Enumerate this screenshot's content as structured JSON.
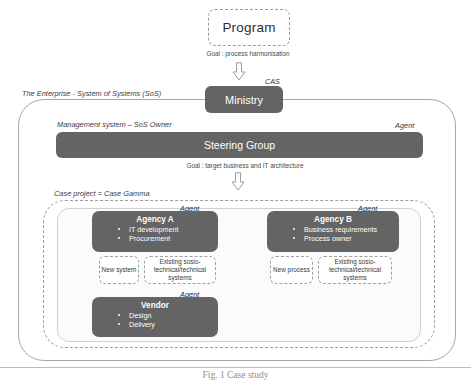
{
  "program": {
    "label": "Program",
    "goal": "Goal : process harmonisation"
  },
  "cas": {
    "tag": "CAS",
    "label": "Ministry"
  },
  "enterprise": {
    "title": "The Enterprise - System of Systems (SoS)"
  },
  "management": {
    "title": "Management system – SoS Owner",
    "agent_tag": "Agent",
    "label": "Steering Group",
    "goal": "Goal : target business and IT architecture"
  },
  "case_project": {
    "title": "Case project = Case Gamma"
  },
  "agents": [
    {
      "agent_tag": "Agent",
      "title": "Agency A",
      "items": [
        "IT development",
        "Procurement"
      ],
      "subboxes": [
        "New system",
        "Existing sosio-technical/technical systems"
      ]
    },
    {
      "agent_tag": "Agent",
      "title": "Agency B",
      "items": [
        "Business requirements",
        "Process owner"
      ],
      "subboxes": [
        "New process",
        "Existing sosio-technical/technical systems"
      ]
    },
    {
      "agent_tag": "Agent",
      "title": "Vendor",
      "items": [
        "Design",
        "Delivery"
      ],
      "subboxes": []
    }
  ],
  "caption": "Fig. 1   Case study",
  "colors": {
    "card_fill": "#646464",
    "card_text": "#ffffff",
    "outline": "#a7a7a7",
    "dashed": "#9d9d9d"
  }
}
